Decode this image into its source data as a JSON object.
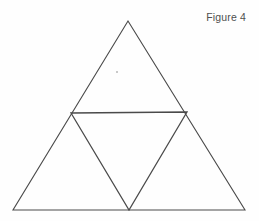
{
  "figure": {
    "label": "Figure 4",
    "background_color": "#fefefe",
    "stroke_color": "#4a4a4a",
    "label_color": "#4f4f4f",
    "artifact_color": "#c9c9c9"
  },
  "chart_data": {
    "type": "diagram",
    "title": "Figure 4",
    "xlabel": "",
    "ylabel": "",
    "grid": false,
    "legend": false,
    "canvas": {
      "width": 259,
      "height": 221
    },
    "points": {
      "apex": [
        128,
        21
      ],
      "bottom_left": [
        13,
        210
      ],
      "bottom_right": [
        245,
        210
      ],
      "left_midpoint": [
        71,
        113
      ],
      "right_midpoint": [
        187,
        112
      ],
      "bottom_midpoint": [
        129,
        210
      ]
    },
    "shapes": [
      {
        "name": "outer-triangle",
        "kind": "polygon",
        "vertices": [
          [
            128,
            21
          ],
          [
            245,
            210
          ],
          [
            13,
            210
          ]
        ],
        "fill": "none",
        "stroke": "#4a4a4a",
        "stroke_width": 1.1
      },
      {
        "name": "inner-inverted-triangle",
        "kind": "polygon",
        "vertices": [
          [
            71,
            113
          ],
          [
            187,
            112
          ],
          [
            129,
            210
          ]
        ],
        "fill": "none",
        "stroke": "#4a4a4a",
        "stroke_width": 1.3
      }
    ],
    "sub_triangles": [
      {
        "name": "top-sub-triangle",
        "vertices": [
          [
            128,
            21
          ],
          [
            187,
            112
          ],
          [
            71,
            113
          ]
        ]
      },
      {
        "name": "bottom-left-sub-triangle",
        "vertices": [
          [
            71,
            113
          ],
          [
            129,
            210
          ],
          [
            13,
            210
          ]
        ]
      },
      {
        "name": "bottom-right-sub-triangle",
        "vertices": [
          [
            187,
            112
          ],
          [
            245,
            210
          ],
          [
            129,
            210
          ]
        ]
      },
      {
        "name": "center-inverted-sub-triangle",
        "vertices": [
          [
            71,
            113
          ],
          [
            187,
            112
          ],
          [
            129,
            210
          ]
        ]
      }
    ],
    "artifacts": [
      {
        "name": "scan-speck",
        "position": [
          116,
          71
        ],
        "size": [
          2,
          2
        ]
      }
    ]
  }
}
